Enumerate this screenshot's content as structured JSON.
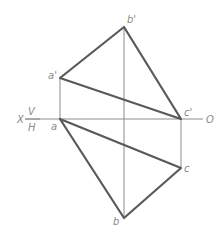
{
  "diagram": {
    "type": "orthographic-projection-triangle",
    "axis": {
      "left_label": "X",
      "right_label": "O",
      "upper_plane": "V",
      "lower_plane": "H",
      "y": 119,
      "x_start": 25,
      "x_end": 203
    },
    "points": {
      "a_prime": {
        "label": "a'",
        "x": 60,
        "y": 78
      },
      "b_prime": {
        "label": "b'",
        "x": 124,
        "y": 27
      },
      "c_prime": {
        "label": "c'",
        "x": 181,
        "y": 119
      },
      "a": {
        "label": "a",
        "x": 60,
        "y": 119
      },
      "b": {
        "label": "b",
        "x": 124,
        "y": 218
      },
      "c": {
        "label": "c",
        "x": 181,
        "y": 168
      }
    },
    "colors": {
      "thick_line": "#595959",
      "thin_line": "#8c8c8c",
      "label": "#8a8a8a"
    }
  }
}
